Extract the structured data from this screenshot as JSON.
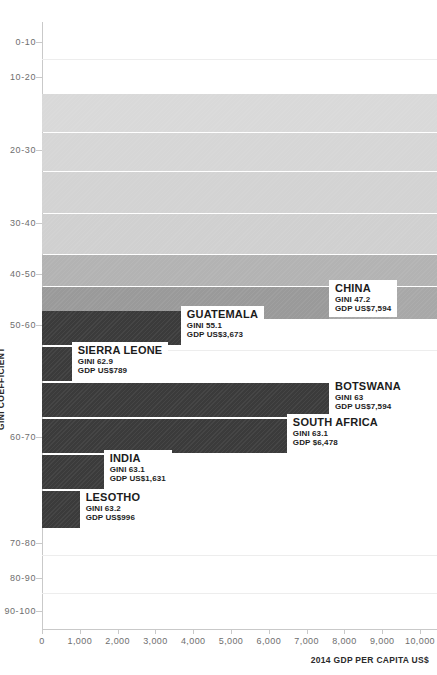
{
  "chart_data": {
    "type": "bar",
    "orientation": "horizontal",
    "title": "",
    "xlabel": "2014 GDP PER CAPITA US$",
    "ylabel": "GINI COEFFICIENT",
    "xlim": [
      0,
      10000
    ],
    "xticks": [
      "0",
      "1,000",
      "2,000",
      "3,000",
      "4,000",
      "5,000",
      "6,000",
      "7,000",
      "8,000",
      "9,000",
      "10,000"
    ],
    "xtick_values": [
      0,
      1000,
      2000,
      3000,
      4000,
      5000,
      6000,
      7000,
      8000,
      9000,
      10000
    ],
    "ycategories": [
      "0-10",
      "10-20",
      "20-30",
      "30-40",
      "40-50",
      "50-60",
      "60-70",
      "70-80",
      "80-90",
      "90-100"
    ],
    "grid": true,
    "legend": "none",
    "series": [
      {
        "name": "CHINA",
        "gini_label": "GINI 47.2",
        "gdp_label": "GDP US$7,594",
        "gini": 47.2,
        "gdp": 7594,
        "color": "#9a9a9a"
      },
      {
        "name": "GUATEMALA",
        "gini_label": "GINI 55.1",
        "gdp_label": "GDP US$3,673",
        "gini": 55.1,
        "gdp": 3673,
        "color": "#3b3b3b"
      },
      {
        "name": "SIERRA LEONE",
        "gini_label": "GINI 62.9",
        "gdp_label": "GDP US$789",
        "gini": 62.9,
        "gdp": 789,
        "color": "#3b3b3b"
      },
      {
        "name": "BOTSWANA",
        "gini_label": "GINI 63",
        "gdp_label": "GDP US$7,594",
        "gini": 63,
        "gdp": 7594,
        "color": "#3b3b3b"
      },
      {
        "name": "SOUTH AFRICA",
        "gini_label": "GINI 63.1",
        "gdp_label": "GDP $6,478",
        "gini": 63.1,
        "gdp": 6478,
        "color": "#3b3b3b"
      },
      {
        "name": "INDIA",
        "gini_label": "GINI 63.1",
        "gdp_label": "GDP US$1,631",
        "gini": 63.1,
        "gdp": 1631,
        "color": "#3b3b3b"
      },
      {
        "name": "LESOTHO",
        "gini_label": "GINI 63.2",
        "gdp_label": "GDP US$996",
        "gini": 63.2,
        "gdp": 996,
        "color": "#3b3b3b"
      }
    ],
    "background_bands": [
      {
        "color": "#d9d9d9"
      },
      {
        "color": "#d6d6d6"
      },
      {
        "color": "#d2d2d2"
      },
      {
        "color": "#cecece"
      },
      {
        "color": "#b4b4b4"
      },
      {
        "color": "#a6a6a6"
      }
    ]
  },
  "axes": {
    "x_title": "2014 GDP PER CAPITA US$",
    "y_title": "GINI COEFFICIENT"
  }
}
